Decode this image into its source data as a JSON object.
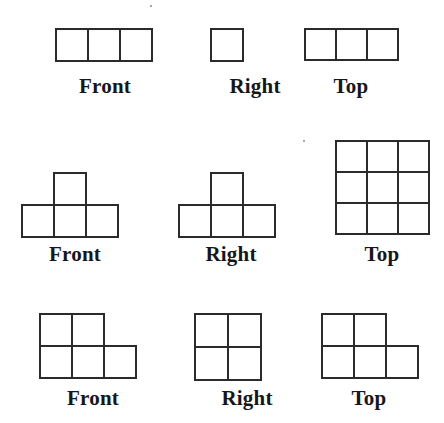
{
  "page": {
    "background_color": "#ffffff",
    "stroke_color": "#2b2b2b",
    "text_color": "#17171a",
    "cell_size": 32
  },
  "rows": [
    {
      "id": "row-1",
      "top": 16,
      "label_top": 74,
      "views": [
        {
          "id": "row1-front",
          "label": "Front",
          "left": 55,
          "label_left": 40,
          "label_width": 130,
          "shape_top": 12,
          "cell": 32,
          "cells": [
            {
              "col": 0,
              "row": 0
            },
            {
              "col": 1,
              "row": 0
            },
            {
              "col": 2,
              "row": 0
            }
          ]
        },
        {
          "id": "row1-right",
          "label": "Right",
          "left": 210,
          "label_left": 190,
          "label_width": 130,
          "shape_top": 12,
          "cell": 32,
          "cells": [
            {
              "col": 0,
              "row": 0
            }
          ]
        },
        {
          "id": "row1-top",
          "label": "Top",
          "left": 304,
          "label_left": 295,
          "label_width": 112,
          "shape_top": 12,
          "cell": 31,
          "cells": [
            {
              "col": 0,
              "row": 0
            },
            {
              "col": 1,
              "row": 0
            },
            {
              "col": 2,
              "row": 0
            }
          ]
        }
      ]
    },
    {
      "id": "row-2",
      "top": 140,
      "label_top": 242,
      "views": [
        {
          "id": "row2-front",
          "label": "Front",
          "left": 21,
          "label_left": 10,
          "label_width": 130,
          "shape_top": 32,
          "cell": 32,
          "cells": [
            {
              "col": 1,
              "row": 0
            },
            {
              "col": 0,
              "row": 1
            },
            {
              "col": 1,
              "row": 1
            },
            {
              "col": 2,
              "row": 1
            }
          ]
        },
        {
          "id": "row2-right",
          "label": "Right",
          "left": 178,
          "label_left": 168,
          "label_width": 126,
          "shape_top": 32,
          "cell": 32,
          "cells": [
            {
              "col": 1,
              "row": 0
            },
            {
              "col": 0,
              "row": 1
            },
            {
              "col": 1,
              "row": 1
            },
            {
              "col": 2,
              "row": 1
            }
          ]
        },
        {
          "id": "row2-top",
          "label": "Top",
          "left": 335,
          "label_left": 325,
          "label_width": 114,
          "shape_top": 0,
          "cell": 31,
          "cells": [
            {
              "col": 0,
              "row": 0
            },
            {
              "col": 1,
              "row": 0
            },
            {
              "col": 2,
              "row": 0
            },
            {
              "col": 0,
              "row": 1
            },
            {
              "col": 1,
              "row": 1
            },
            {
              "col": 2,
              "row": 1
            },
            {
              "col": 0,
              "row": 2
            },
            {
              "col": 1,
              "row": 2
            },
            {
              "col": 2,
              "row": 2
            }
          ]
        }
      ]
    },
    {
      "id": "row-3",
      "top": 313,
      "label_top": 386,
      "views": [
        {
          "id": "row3-front",
          "label": "Front",
          "left": 39,
          "label_left": 28,
          "label_width": 130,
          "shape_top": 0,
          "cell": 32,
          "cells": [
            {
              "col": 0,
              "row": 0
            },
            {
              "col": 1,
              "row": 0
            },
            {
              "col": 0,
              "row": 1
            },
            {
              "col": 1,
              "row": 1
            },
            {
              "col": 2,
              "row": 1
            }
          ]
        },
        {
          "id": "row3-right",
          "label": "Right",
          "left": 194,
          "label_left": 184,
          "label_width": 126,
          "shape_top": 0,
          "cell": 33,
          "cells": [
            {
              "col": 0,
              "row": 0
            },
            {
              "col": 1,
              "row": 0
            },
            {
              "col": 0,
              "row": 1
            },
            {
              "col": 1,
              "row": 1
            }
          ]
        },
        {
          "id": "row3-top",
          "label": "Top",
          "left": 321,
          "label_left": 312,
          "label_width": 114,
          "shape_top": 0,
          "cell": 32,
          "cells": [
            {
              "col": 0,
              "row": 0
            },
            {
              "col": 1,
              "row": 0
            },
            {
              "col": 0,
              "row": 1
            },
            {
              "col": 1,
              "row": 1
            },
            {
              "col": 2,
              "row": 1
            }
          ]
        }
      ]
    }
  ],
  "specks": [
    {
      "left": 303,
      "top": 140
    },
    {
      "left": 150,
      "top": 5
    }
  ],
  "labels": {
    "front": "Front",
    "right": "Right",
    "top": "Top"
  }
}
